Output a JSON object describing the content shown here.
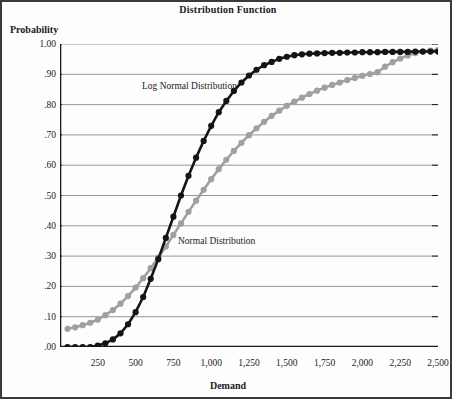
{
  "chart_data": {
    "type": "line",
    "title": "Distribution Function",
    "xlabel": "Demand",
    "ylabel": "Probability",
    "xlim": [
      0,
      2500
    ],
    "ylim": [
      0,
      1.0
    ],
    "grid": true,
    "legend_position": "inline-annotations",
    "xticks": [
      250,
      500,
      750,
      1000,
      1250,
      1500,
      1750,
      2000,
      2250,
      2500
    ],
    "xtick_labels": [
      "250",
      "500",
      "750",
      "1,000",
      "1,250",
      "1,500",
      "1,750",
      "2,000",
      "2,250",
      "2,500"
    ],
    "xtick_minor_step": 50,
    "yticks": [
      0.0,
      0.1,
      0.2,
      0.3,
      0.4,
      0.5,
      0.6,
      0.7,
      0.8,
      0.9,
      1.0
    ],
    "ytick_labels": [
      ".00",
      ".10",
      ".20",
      ".30",
      ".40",
      ".50",
      ".60",
      ".70",
      ".80",
      ".90",
      "1.00"
    ],
    "x": [
      50,
      100,
      150,
      200,
      250,
      300,
      350,
      400,
      450,
      500,
      550,
      600,
      650,
      700,
      750,
      800,
      850,
      900,
      950,
      1000,
      1050,
      1100,
      1150,
      1200,
      1250,
      1300,
      1350,
      1400,
      1450,
      1500,
      1550,
      1600,
      1650,
      1700,
      1750,
      1800,
      1850,
      1900,
      1950,
      2000,
      2050,
      2100,
      2150,
      2200,
      2250,
      2300,
      2350,
      2400,
      2450,
      2500
    ],
    "series": [
      {
        "name": "Normal Distribution",
        "color": "#141414",
        "marker": "circle",
        "values": [
          0.0,
          0.0,
          0.0,
          0.0,
          0.005,
          0.012,
          0.025,
          0.045,
          0.075,
          0.115,
          0.165,
          0.225,
          0.29,
          0.36,
          0.43,
          0.5,
          0.565,
          0.625,
          0.68,
          0.73,
          0.775,
          0.812,
          0.845,
          0.873,
          0.896,
          0.915,
          0.93,
          0.941,
          0.951,
          0.958,
          0.963,
          0.966,
          0.968,
          0.969,
          0.97,
          0.971,
          0.971,
          0.972,
          0.972,
          0.973,
          0.973,
          0.973,
          0.974,
          0.974,
          0.974,
          0.974,
          0.975,
          0.975,
          0.975,
          0.975
        ]
      },
      {
        "name": "Log Normal Distribution",
        "color": "#a0a0a0",
        "marker": "circle",
        "values": [
          0.06,
          0.065,
          0.072,
          0.08,
          0.09,
          0.105,
          0.122,
          0.143,
          0.168,
          0.196,
          0.227,
          0.26,
          0.295,
          0.332,
          0.37,
          0.408,
          0.446,
          0.483,
          0.519,
          0.554,
          0.587,
          0.618,
          0.647,
          0.674,
          0.699,
          0.722,
          0.743,
          0.763,
          0.78,
          0.796,
          0.81,
          0.823,
          0.835,
          0.846,
          0.856,
          0.865,
          0.873,
          0.881,
          0.888,
          0.895,
          0.901,
          0.907,
          0.925,
          0.94,
          0.952,
          0.962,
          0.97,
          0.975,
          0.978,
          0.98
        ]
      }
    ],
    "annotations": [
      {
        "text": "Log Normal Distribution",
        "x": 700,
        "y": 0.88
      },
      {
        "text": "Normal Distribution",
        "x": 950,
        "y": 0.37
      }
    ]
  },
  "style": {
    "grid_color": "#8a8a8a",
    "axis_color": "#1b1b1b",
    "background": "#fdfdfd",
    "border_color": "#3a3a3a"
  }
}
